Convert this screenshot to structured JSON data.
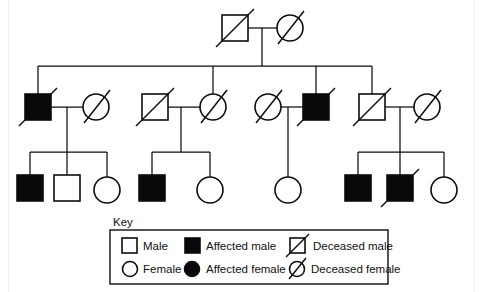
{
  "figure": {
    "type": "pedigree-chart",
    "title_visible": false,
    "background_color": "#ffffff",
    "line_color": "#0d0d0d",
    "filled_color": "#080808",
    "open_color": "#ffffff"
  },
  "key": {
    "label": "Key",
    "entries": [
      {
        "id": "male",
        "symbol": "open-square",
        "label": "Male"
      },
      {
        "id": "affected-male",
        "symbol": "filled-square",
        "label": "Affected male"
      },
      {
        "id": "deceased-male",
        "symbol": "open-square-slashed",
        "label": "Deceased male"
      },
      {
        "id": "female",
        "symbol": "open-circle",
        "label": "Female"
      },
      {
        "id": "affected-female",
        "symbol": "filled-circle",
        "label": "Affected female"
      },
      {
        "id": "deceased-female",
        "symbol": "open-circle-slashed",
        "label": "Deceased female"
      }
    ]
  },
  "generations": [
    {
      "id": "generation-1",
      "label": "Generation I",
      "y": 28,
      "individuals": [
        {
          "id": "I-1",
          "sex": "male",
          "shape": "square",
          "affected": false,
          "deceased": true,
          "x": 235,
          "y": 28
        },
        {
          "id": "I-2",
          "sex": "female",
          "shape": "circle",
          "affected": false,
          "deceased": true,
          "x": 290,
          "y": 28
        }
      ]
    },
    {
      "id": "generation-2",
      "label": "Generation II",
      "y": 107,
      "individuals": [
        {
          "id": "II-1",
          "sex": "male",
          "shape": "square",
          "affected": true,
          "deceased": true,
          "x": 38,
          "y": 107
        },
        {
          "id": "II-2",
          "sex": "female",
          "shape": "circle",
          "affected": false,
          "deceased": true,
          "x": 96,
          "y": 107
        },
        {
          "id": "II-3",
          "sex": "male",
          "shape": "square",
          "affected": false,
          "deceased": true,
          "x": 155,
          "y": 107
        },
        {
          "id": "II-4",
          "sex": "female",
          "shape": "circle",
          "affected": false,
          "deceased": true,
          "x": 213,
          "y": 107
        },
        {
          "id": "II-5",
          "sex": "female",
          "shape": "circle",
          "affected": false,
          "deceased": true,
          "x": 268,
          "y": 107
        },
        {
          "id": "II-6",
          "sex": "male",
          "shape": "square",
          "affected": true,
          "deceased": true,
          "x": 316,
          "y": 107
        },
        {
          "id": "II-7",
          "sex": "male",
          "shape": "square",
          "affected": false,
          "deceased": true,
          "x": 372,
          "y": 107
        },
        {
          "id": "II-8",
          "sex": "female",
          "shape": "circle",
          "affected": false,
          "deceased": true,
          "x": 427,
          "y": 107
        }
      ]
    },
    {
      "id": "generation-3",
      "label": "Generation III",
      "y": 188,
      "individuals": [
        {
          "id": "III-1",
          "sex": "male",
          "shape": "square",
          "affected": true,
          "deceased": false,
          "x": 30,
          "y": 188
        },
        {
          "id": "III-2",
          "sex": "male",
          "shape": "square",
          "affected": false,
          "deceased": false,
          "x": 67,
          "y": 188
        },
        {
          "id": "III-3",
          "sex": "female",
          "shape": "circle",
          "affected": false,
          "deceased": false,
          "x": 107,
          "y": 188
        },
        {
          "id": "III-4",
          "sex": "male",
          "shape": "square",
          "affected": true,
          "deceased": false,
          "x": 152,
          "y": 188
        },
        {
          "id": "III-5",
          "sex": "female",
          "shape": "circle",
          "affected": false,
          "deceased": false,
          "x": 210,
          "y": 188
        },
        {
          "id": "III-6",
          "sex": "female",
          "shape": "circle",
          "affected": false,
          "deceased": false,
          "x": 288,
          "y": 188
        },
        {
          "id": "III-7",
          "sex": "male",
          "shape": "square",
          "affected": true,
          "deceased": false,
          "x": 358,
          "y": 188
        },
        {
          "id": "III-8",
          "sex": "male",
          "shape": "square",
          "affected": true,
          "deceased": true,
          "x": 400,
          "y": 188
        },
        {
          "id": "III-9",
          "sex": "female",
          "shape": "circle",
          "affected": false,
          "deceased": false,
          "x": 444,
          "y": 188
        }
      ]
    }
  ],
  "matings": [
    {
      "id": "mating-1",
      "partners": [
        "I-1",
        "I-2"
      ],
      "children": [
        "II-1",
        "II-4",
        "II-6",
        "II-7"
      ]
    },
    {
      "id": "mating-2",
      "partners": [
        "II-1",
        "II-2"
      ],
      "children": [
        "III-1",
        "III-2",
        "III-3"
      ]
    },
    {
      "id": "mating-3",
      "partners": [
        "II-3",
        "II-4"
      ],
      "children": [
        "III-4",
        "III-5"
      ]
    },
    {
      "id": "mating-4",
      "partners": [
        "II-5",
        "II-6"
      ],
      "children": [
        "III-6"
      ]
    },
    {
      "id": "mating-5",
      "partners": [
        "II-7",
        "II-8"
      ],
      "children": [
        "III-7",
        "III-8",
        "III-9"
      ]
    }
  ],
  "counts": {
    "total_individuals": 19,
    "affected_males": 7,
    "affected_females": 0,
    "deceased_individuals": 11
  }
}
